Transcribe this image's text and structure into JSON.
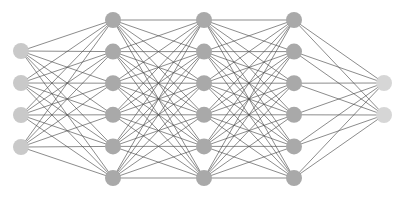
{
  "diagram": {
    "type": "feedforward-neural-network",
    "canvas": {
      "width": 404,
      "height": 209,
      "background": "#ffffff"
    },
    "node_radius": 8,
    "edge_color": "#4a4a4a",
    "layers": [
      {
        "name": "input",
        "x": 21,
        "node_count": 4,
        "color": "#c9c9c9",
        "y": [
          51,
          83,
          115,
          147
        ]
      },
      {
        "name": "hidden-1",
        "x": 113,
        "node_count": 6,
        "color": "#a9a9a9",
        "y": [
          20,
          51.6,
          83.2,
          114.8,
          146.4,
          178
        ]
      },
      {
        "name": "hidden-2",
        "x": 204,
        "node_count": 6,
        "color": "#a9a9a9",
        "y": [
          20,
          51.6,
          83.2,
          114.8,
          146.4,
          178
        ]
      },
      {
        "name": "hidden-3",
        "x": 294,
        "node_count": 6,
        "color": "#a9a9a9",
        "y": [
          20,
          51.6,
          83.2,
          114.8,
          146.4,
          178
        ]
      },
      {
        "name": "output",
        "x": 384,
        "node_count": 2,
        "color": "#d6d6d6",
        "y": [
          83,
          115
        ]
      }
    ],
    "connectivity": "fully-connected between adjacent layers",
    "bottom_labels_cropped": true
  }
}
